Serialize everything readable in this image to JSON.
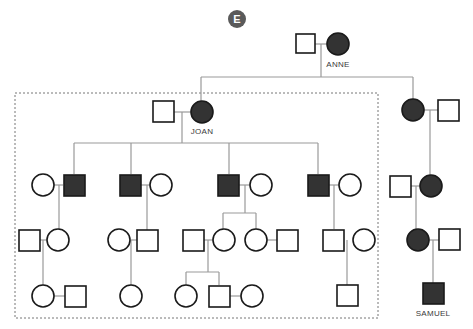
{
  "badge": {
    "letter": "E",
    "color": "#5a5a5a"
  },
  "colors": {
    "affected": "#333333",
    "unaffected_fill": "#ffffff",
    "stroke": "#1a1a1a",
    "line": "#999999",
    "dashed_box": "#777777"
  },
  "labels": {
    "anne": "ANNE",
    "joan": "JOAN",
    "samuel": "SAMUEL"
  },
  "legend": {
    "square": "male",
    "circle": "female",
    "filled": "affected",
    "open": "unaffected",
    "dashed_box": "Joan's family"
  },
  "individuals": [
    {
      "id": "g1-father",
      "sex": "male",
      "affected": false
    },
    {
      "id": "anne",
      "sex": "female",
      "affected": true,
      "label": "ANNE"
    },
    {
      "id": "joan-husband",
      "sex": "male",
      "affected": false
    },
    {
      "id": "joan",
      "sex": "female",
      "affected": true,
      "label": "JOAN"
    },
    {
      "id": "anne-daughter2",
      "sex": "female",
      "affected": true
    },
    {
      "id": "anne-daughter2-husband",
      "sex": "male",
      "affected": false
    },
    {
      "id": "samuel",
      "sex": "male",
      "affected": true,
      "label": "SAMUEL"
    }
  ]
}
